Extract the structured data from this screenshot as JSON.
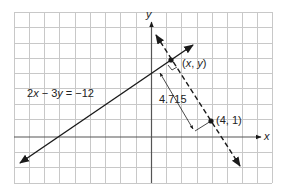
{
  "diagram": {
    "type": "coordinate-plane",
    "axes": {
      "x_label": "x",
      "y_label": "y"
    },
    "equation_label": "2x − 3y = −12",
    "equation_parts": {
      "a": "2",
      "x": "x",
      "op": " − 3",
      "y": "y",
      "rhs": " = −12"
    },
    "point_xy_label": "(x, y)",
    "point_xy_parts": {
      "open": "(",
      "x": "x",
      "comma": ", ",
      "y": "y",
      "close": ")"
    },
    "point_given_label": "(4, 1)",
    "distance_label": "4.715",
    "colors": {
      "grid": "#c8c8c8",
      "axis": "#555555",
      "line": "#1a1a1a"
    }
  }
}
